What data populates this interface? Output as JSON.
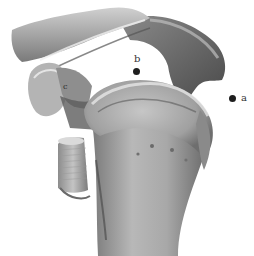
{
  "figure": {
    "colors": {
      "background": "#ffffff",
      "bone_light": "#d8d8d8",
      "bone_mid": "#9a9a9a",
      "bone_dark": "#4a4a4a",
      "marker": "#1e1e1e"
    }
  },
  "annotations": [
    {
      "id": "a",
      "label": "a",
      "dot_x": 232,
      "dot_y": 98,
      "label_x": 241,
      "label_y": 93
    },
    {
      "id": "b",
      "label": "b",
      "dot_x": 136,
      "dot_y": 71,
      "label_x": 134,
      "label_y": 54
    },
    {
      "id": "c",
      "label": "c",
      "dot_x": 0,
      "dot_y": 0,
      "label_x": 63,
      "label_y": 83
    }
  ]
}
